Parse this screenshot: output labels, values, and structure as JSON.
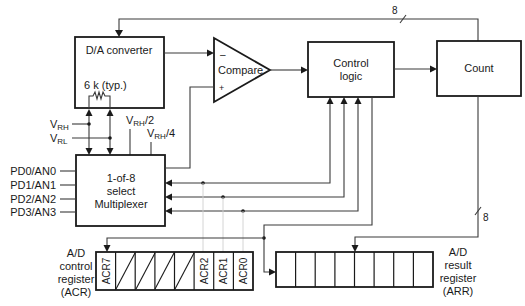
{
  "diagram": {
    "blocks": {
      "dac": {
        "label": "D/A converter",
        "resistor_label": "6 k (typ.)"
      },
      "comparator": {
        "label": "Compare",
        "minus": "–",
        "plus": "+"
      },
      "control": {
        "line1": "Control",
        "line2": "logic"
      },
      "count": {
        "label": "Count"
      },
      "mux": {
        "line1": "1-of-8",
        "line2": "select",
        "line3": "Multiplexer"
      }
    },
    "references": {
      "vrh": {
        "main": "V",
        "sub": "RH"
      },
      "vrl": {
        "main": "V",
        "sub": "RL"
      },
      "vrh_half": {
        "main": "V",
        "sub": "RH",
        "suffix": "/2"
      },
      "vrh_quarter": {
        "main": "V",
        "sub": "RH",
        "suffix": "/4"
      }
    },
    "inputs": [
      "PD0/AN0",
      "PD1/AN1",
      "PD2/AN2",
      "PD3/AN3"
    ],
    "bus_widths": {
      "top_bus": "8",
      "result_bus": "8"
    },
    "acr": {
      "label_lines": [
        "A/D",
        "control",
        "register",
        "(ACR)"
      ],
      "cells": [
        "ACR7",
        "",
        "",
        "",
        "",
        "ACR2",
        "ACR1",
        "ACR0"
      ]
    },
    "arr": {
      "label_lines": [
        "A/D",
        "result",
        "register",
        "(ARR)"
      ],
      "cell_count": 8
    },
    "colors": {
      "stroke": "#1a1a1a",
      "wire": "#3a3a3a",
      "faint": "#cfcfcf",
      "background": "#ffffff"
    }
  }
}
